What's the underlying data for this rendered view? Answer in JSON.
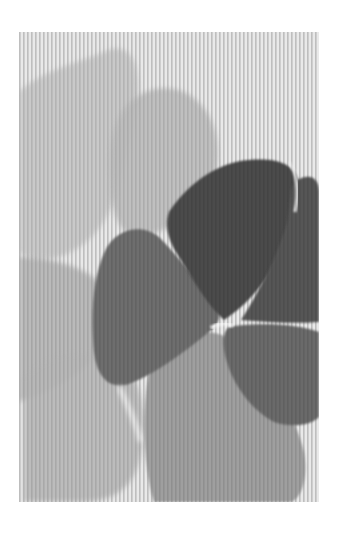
{
  "image": {
    "subject": "monochrome painting of overlapping flower petals on laid paper",
    "palette": {
      "page_background": "#ffffff",
      "paper": "#e8e8e8",
      "stripe": "#d4d4d4",
      "pale_petal": "#bdbdbd",
      "mid_petal": "#9e9e9e",
      "dark_petal": "#5e5e5e",
      "darkest_petal": "#4a4a4a",
      "highlight": "#f2f2f2"
    }
  }
}
